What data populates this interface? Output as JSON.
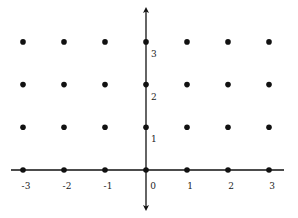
{
  "diagram": {
    "type": "integer-lattice",
    "x_labels": [
      "-3",
      "-2",
      "-1",
      "0",
      "1",
      "2",
      "3"
    ],
    "y_labels": [
      "1",
      "2",
      "3"
    ],
    "x_range": [
      -3,
      3
    ],
    "y_range": [
      0,
      3
    ],
    "points_x": [
      -3,
      -2,
      -1,
      0,
      1,
      2,
      3
    ],
    "points_y": [
      0,
      1,
      2,
      3
    ],
    "colors": {
      "axis": "#111111",
      "point": "#111111",
      "label": "#222222",
      "background": "#ffffff"
    }
  }
}
